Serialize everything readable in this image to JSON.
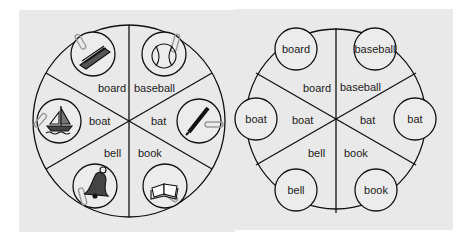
{
  "left_wheel": {
    "sector_labels": [
      "board",
      "baseball",
      "boat",
      "bat",
      "bell",
      "book"
    ],
    "picture_icons": [
      "board-icon",
      "baseball-icon",
      "boat-icon",
      "bat-icon",
      "bell-icon",
      "book-icon"
    ]
  },
  "right_wheel": {
    "sector_labels": [
      "board",
      "baseball",
      "boat",
      "bat",
      "bell",
      "book"
    ],
    "word_cards": [
      "board",
      "baseball",
      "boat",
      "bat",
      "bell",
      "book"
    ]
  },
  "colors": {
    "panel_background": "#e9e9e9",
    "line": "#111111",
    "page_background": "#ffffff"
  }
}
